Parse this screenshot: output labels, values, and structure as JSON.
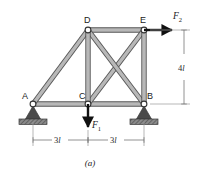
{
  "figure": {
    "caption": "(a)",
    "joint_labels": {
      "A": "A",
      "B": "B",
      "C": "C",
      "D": "D",
      "E": "E"
    },
    "loads": [
      {
        "name": "F1",
        "base": "F",
        "sub": "1",
        "direction": "down",
        "at_joint": "C"
      },
      {
        "name": "F2",
        "base": "F",
        "sub": "2",
        "direction": "right",
        "at_joint": "E"
      }
    ],
    "dimensions": [
      {
        "name": "height",
        "value": "4",
        "unit": "l",
        "orientation": "vertical"
      },
      {
        "name": "span-left",
        "value": "3",
        "unit": "l",
        "orientation": "horizontal"
      },
      {
        "name": "span-right",
        "value": "3",
        "unit": "l",
        "orientation": "horizontal"
      }
    ],
    "supports": [
      {
        "at_joint": "A",
        "type": "pin-hatched"
      },
      {
        "at_joint": "B",
        "type": "pin-hatched"
      }
    ],
    "members": [
      "A-C",
      "C-B",
      "D-E",
      "A-D",
      "D-C",
      "E-B",
      "C-E",
      "D-B"
    ],
    "colors": {
      "member_fill": "#b4b4b4",
      "member_stroke": "#555555",
      "joint_fill": "#ffffff",
      "joint_stroke": "#333333",
      "support_fill": "#4a4a4a",
      "arrow": "#111111",
      "dimension": "#777777"
    }
  }
}
